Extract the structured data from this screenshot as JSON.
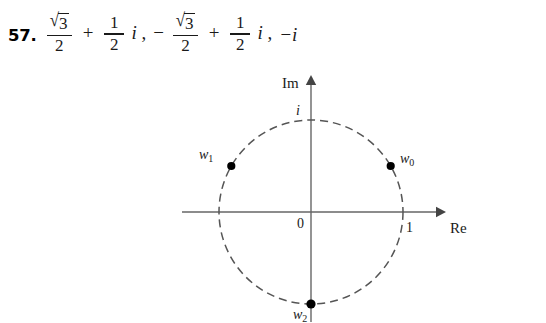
{
  "exercise": {
    "number": "57.",
    "terms": [
      {
        "sign": "",
        "real_num": "3",
        "real_has_sqrt": true,
        "real_den": "2",
        "operator": "+",
        "imag_num": "1",
        "imag_den": "2",
        "imag_unit": "i",
        "trailing": ","
      },
      {
        "sign": "−",
        "real_num": "3",
        "real_has_sqrt": true,
        "real_den": "2",
        "operator": "+",
        "imag_num": "1",
        "imag_den": "2",
        "imag_unit": "i",
        "trailing": ","
      }
    ],
    "third_term": "−i",
    "radical_sign": "√"
  },
  "diagram": {
    "type": "argand-diagram",
    "axes": {
      "imaginary_label": "Im",
      "real_label": "Re",
      "origin_label": "0"
    },
    "ticks": [
      {
        "label": "1",
        "axis": "real",
        "value": 1
      },
      {
        "label": "i",
        "axis": "imaginary",
        "value": 1
      }
    ],
    "circle": {
      "style": "dashed",
      "radius_value": 1,
      "center_x": 311,
      "center_y": 212,
      "radius_px": 92,
      "dash": "8 5",
      "color": "#555555"
    },
    "points": [
      {
        "label": "w",
        "subscript": "0",
        "angle_deg": 30,
        "re": 0.866,
        "im": 0.5,
        "cx": 390.7,
        "cy": 166.0,
        "label_x": 400,
        "label_y": 163
      },
      {
        "label": "w",
        "subscript": "1",
        "angle_deg": 150,
        "re": -0.866,
        "im": 0.5,
        "cx": 231.3,
        "cy": 166.0,
        "label_x": 199,
        "label_y": 159
      },
      {
        "label": "w",
        "subscript": "2",
        "angle_deg": 270,
        "re": 0,
        "im": -1,
        "cx": 311.0,
        "cy": 304.0,
        "label_x": 293,
        "label_y": 319
      }
    ],
    "colors": {
      "axis": "#666666",
      "point": "#000000",
      "circle": "#555555",
      "text": "#1a1a1a",
      "background": "#ffffff"
    }
  }
}
